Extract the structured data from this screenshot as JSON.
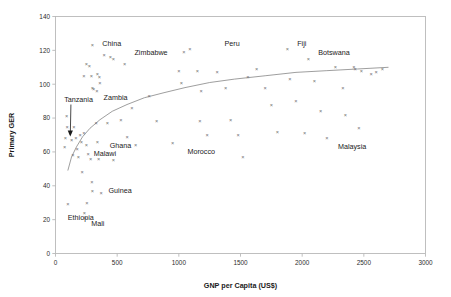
{
  "chart_data": {
    "type": "scatter",
    "title": "",
    "xlabel": "GNP per Capita (US$)",
    "ylabel": "Primary GER",
    "xlim": [
      0,
      3000
    ],
    "ylim": [
      0,
      140
    ],
    "xticks": [
      0,
      500,
      1000,
      1500,
      2000,
      2500,
      3000
    ],
    "yticks": [
      0,
      20,
      40,
      60,
      80,
      100,
      120,
      140
    ],
    "grid": false,
    "legend": null,
    "marker": "x",
    "marker_color": "#6f6f6f",
    "trendline": {
      "type": "logarithmic",
      "color": "#8d8d8d",
      "points": [
        [
          100,
          49
        ],
        [
          130,
          57
        ],
        [
          170,
          63
        ],
        [
          220,
          69
        ],
        [
          280,
          74
        ],
        [
          360,
          79
        ],
        [
          460,
          84
        ],
        [
          580,
          88
        ],
        [
          720,
          92
        ],
        [
          880,
          95
        ],
        [
          1050,
          98
        ],
        [
          1250,
          101
        ],
        [
          1450,
          103
        ],
        [
          1700,
          105
        ],
        [
          1950,
          107
        ],
        [
          2200,
          108
        ],
        [
          2450,
          109
        ],
        [
          2700,
          110
        ]
      ]
    },
    "points": [
      {
        "x": 90,
        "y": 81
      },
      {
        "x": 95,
        "y": 75
      },
      {
        "x": 80,
        "y": 68
      },
      {
        "x": 75,
        "y": 63
      },
      {
        "x": 120,
        "y": 72
      },
      {
        "x": 130,
        "y": 67
      },
      {
        "x": 140,
        "y": 58
      },
      {
        "x": 150,
        "y": 75
      },
      {
        "x": 165,
        "y": 68
      },
      {
        "x": 175,
        "y": 62
      },
      {
        "x": 185,
        "y": 57
      },
      {
        "x": 200,
        "y": 70
      },
      {
        "x": 210,
        "y": 66
      },
      {
        "x": 215,
        "y": 48
      },
      {
        "x": 230,
        "y": 71
      },
      {
        "x": 250,
        "y": 64
      },
      {
        "x": 265,
        "y": 59
      },
      {
        "x": 285,
        "y": 56
      },
      {
        "x": 295,
        "y": 42
      },
      {
        "x": 300,
        "y": 37
      },
      {
        "x": 330,
        "y": 77
      },
      {
        "x": 340,
        "y": 66
      },
      {
        "x": 350,
        "y": 56
      },
      {
        "x": 370,
        "y": 36
      },
      {
        "x": 420,
        "y": 77
      },
      {
        "x": 470,
        "y": 55
      },
      {
        "x": 100,
        "y": 29
      },
      {
        "x": 255,
        "y": 30
      },
      {
        "x": 235,
        "y": 24
      },
      {
        "x": 240,
        "y": 21
      },
      {
        "x": 300,
        "y": 98
      },
      {
        "x": 310,
        "y": 97
      },
      {
        "x": 335,
        "y": 96
      },
      {
        "x": 250,
        "y": 112
      },
      {
        "x": 275,
        "y": 111
      },
      {
        "x": 230,
        "y": 105
      },
      {
        "x": 290,
        "y": 105
      },
      {
        "x": 340,
        "y": 106
      },
      {
        "x": 355,
        "y": 104
      },
      {
        "x": 360,
        "y": 101
      },
      {
        "x": 395,
        "y": 117
      },
      {
        "x": 300,
        "y": 123
      },
      {
        "x": 470,
        "y": 115
      },
      {
        "x": 445,
        "y": 116
      },
      {
        "x": 560,
        "y": 112
      },
      {
        "x": 620,
        "y": 86
      },
      {
        "x": 530,
        "y": 79
      },
      {
        "x": 580,
        "y": 69
      },
      {
        "x": 650,
        "y": 64
      },
      {
        "x": 760,
        "y": 93
      },
      {
        "x": 820,
        "y": 78
      },
      {
        "x": 950,
        "y": 65
      },
      {
        "x": 1000,
        "y": 108
      },
      {
        "x": 1020,
        "y": 101
      },
      {
        "x": 1040,
        "y": 119
      },
      {
        "x": 1090,
        "y": 121
      },
      {
        "x": 1150,
        "y": 108
      },
      {
        "x": 1180,
        "y": 96
      },
      {
        "x": 1170,
        "y": 78
      },
      {
        "x": 1230,
        "y": 70
      },
      {
        "x": 1310,
        "y": 107
      },
      {
        "x": 1380,
        "y": 98
      },
      {
        "x": 1420,
        "y": 79
      },
      {
        "x": 1480,
        "y": 70
      },
      {
        "x": 1520,
        "y": 57
      },
      {
        "x": 1560,
        "y": 104
      },
      {
        "x": 1630,
        "y": 109
      },
      {
        "x": 1700,
        "y": 98
      },
      {
        "x": 1750,
        "y": 88
      },
      {
        "x": 1800,
        "y": 72
      },
      {
        "x": 1880,
        "y": 121
      },
      {
        "x": 1900,
        "y": 103
      },
      {
        "x": 1950,
        "y": 90
      },
      {
        "x": 2020,
        "y": 71
      },
      {
        "x": 2050,
        "y": 115
      },
      {
        "x": 2100,
        "y": 102
      },
      {
        "x": 2150,
        "y": 84
      },
      {
        "x": 2200,
        "y": 68
      },
      {
        "x": 2270,
        "y": 110
      },
      {
        "x": 2330,
        "y": 98
      },
      {
        "x": 2350,
        "y": 82
      },
      {
        "x": 2420,
        "y": 110
      },
      {
        "x": 2430,
        "y": 109
      },
      {
        "x": 2460,
        "y": 74
      },
      {
        "x": 2480,
        "y": 108
      },
      {
        "x": 2560,
        "y": 106
      },
      {
        "x": 2600,
        "y": 107
      },
      {
        "x": 2650,
        "y": 109
      }
    ],
    "annotations": [
      {
        "label": "China",
        "x": 380,
        "y": 124,
        "anchor": "start"
      },
      {
        "label": "Zimbabwe",
        "x": 640,
        "y": 119,
        "anchor": "start"
      },
      {
        "label": "Peru",
        "x": 1370,
        "y": 124,
        "anchor": "start"
      },
      {
        "label": "Fiji",
        "x": 1960,
        "y": 124,
        "anchor": "start"
      },
      {
        "label": "Botswana",
        "x": 2130,
        "y": 119,
        "anchor": "start"
      },
      {
        "label": "Zambia",
        "x": 390,
        "y": 92,
        "anchor": "start"
      },
      {
        "label": "Tanzania",
        "x": 70,
        "y": 91,
        "anchor": "start"
      },
      {
        "label": "Ghana",
        "x": 440,
        "y": 64,
        "anchor": "start"
      },
      {
        "label": "Malawi",
        "x": 310,
        "y": 59,
        "anchor": "start"
      },
      {
        "label": "Morocco",
        "x": 1070,
        "y": 60,
        "anchor": "start"
      },
      {
        "label": "Malaysia",
        "x": 2290,
        "y": 63,
        "anchor": "start"
      },
      {
        "label": "Guinea",
        "x": 430,
        "y": 37,
        "anchor": "start"
      },
      {
        "label": "Ethiopia",
        "x": 100,
        "y": 21,
        "anchor": "start"
      },
      {
        "label": "Mali",
        "x": 290,
        "y": 18,
        "anchor": "start"
      }
    ],
    "arrow": {
      "from": [
        125,
        88
      ],
      "to": [
        120,
        70
      ],
      "note": "Tanzania callout arrow"
    }
  }
}
